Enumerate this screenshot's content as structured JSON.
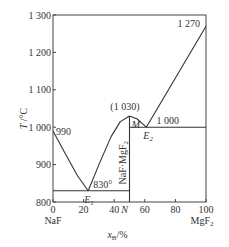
{
  "chart_data": {
    "type": "line",
    "title": "",
    "xlabel": "x_B/%",
    "xlabel_main": "x",
    "xlabel_sub": "B",
    "xlabel_unit": "/%",
    "ylabel": "T /°C",
    "xlim": [
      0,
      100
    ],
    "ylim": [
      800,
      1300
    ],
    "x_ticks": [
      0,
      20,
      40,
      60,
      80,
      100
    ],
    "x_tick_labels": [
      "0",
      "20",
      "40",
      "60",
      "80",
      "100"
    ],
    "y_ticks": [
      800,
      900,
      1000,
      1100,
      1200,
      1300
    ],
    "y_tick_labels": [
      "800",
      "900",
      "1 000",
      "1 100",
      "1 200",
      "1 300"
    ],
    "x_end_labels": {
      "left": "NaF",
      "right": "MgF2",
      "right_main": "MgF",
      "right_sub": "2"
    },
    "grid": false,
    "series": [
      {
        "name": "liquidus-naf",
        "points": [
          [
            0,
            990
          ],
          [
            8,
            930
          ],
          [
            16,
            870
          ],
          [
            23,
            830
          ]
        ]
      },
      {
        "name": "liquidus-compound-left",
        "points": [
          [
            23,
            830
          ],
          [
            30,
            900
          ],
          [
            38,
            975
          ],
          [
            44,
            1015
          ],
          [
            50,
            1030
          ]
        ]
      },
      {
        "name": "liquidus-compound-right",
        "points": [
          [
            50,
            1030
          ],
          [
            55,
            1022
          ],
          [
            61,
            1000
          ]
        ]
      },
      {
        "name": "liquidus-mgf2",
        "points": [
          [
            61,
            1000
          ],
          [
            100,
            1270
          ]
        ]
      },
      {
        "name": "eutectic-line-1",
        "points": [
          [
            0,
            830
          ],
          [
            50,
            830
          ]
        ]
      },
      {
        "name": "eutectic-line-2",
        "points": [
          [
            50,
            1000
          ],
          [
            100,
            1000
          ]
        ]
      },
      {
        "name": "compound-line",
        "points": [
          [
            50,
            800
          ],
          [
            50,
            1030
          ]
        ]
      }
    ],
    "annotations": [
      {
        "text": "990",
        "x": 0,
        "y": 990
      },
      {
        "text": "830°",
        "x": 23,
        "y": 830
      },
      {
        "text": "E1",
        "main": "E",
        "sub": "1",
        "x": 23,
        "y": 830
      },
      {
        "text": "(1 030)",
        "x": 50,
        "y": 1030
      },
      {
        "text": "M",
        "x": 50,
        "y": 1030
      },
      {
        "text": "E2",
        "main": "E",
        "sub": "2",
        "x": 61,
        "y": 1000
      },
      {
        "text": "1 000",
        "x": 75,
        "y": 1000
      },
      {
        "text": "1 270",
        "x": 100,
        "y": 1270
      },
      {
        "text": "N",
        "x": 50,
        "y": 800
      },
      {
        "text": "NaF·MgF2",
        "main": "NaF·MgF",
        "sub": "2",
        "x": 50,
        "y": 900
      }
    ]
  }
}
